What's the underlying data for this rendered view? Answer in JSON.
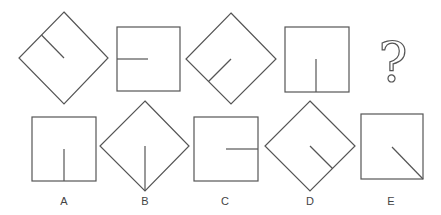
{
  "puzzle": {
    "stroke_color": "#555555",
    "background": "#ffffff",
    "sequence": [
      {
        "id": "seq-1",
        "shape": "diamond",
        "line": "upper-left-edge-midpoint-to-center"
      },
      {
        "id": "seq-2",
        "shape": "square",
        "line": "left-edge-midpoint-to-center"
      },
      {
        "id": "seq-3",
        "shape": "diamond",
        "line": "lower-left-edge-midpoint-to-center"
      },
      {
        "id": "seq-4",
        "shape": "square",
        "line": "bottom-edge-midpoint-to-center"
      }
    ],
    "unknown": {
      "symbol": "?"
    },
    "options": [
      {
        "label": "A",
        "shape": "square",
        "line": "bottom-edge-midpoint-to-center"
      },
      {
        "label": "B",
        "shape": "diamond",
        "line": "bottom-corner-to-center"
      },
      {
        "label": "C",
        "shape": "square",
        "line": "right-edge-midpoint-to-center"
      },
      {
        "label": "D",
        "shape": "diamond",
        "line": "lower-right-edge-midpoint-to-center"
      },
      {
        "label": "E",
        "shape": "square",
        "line": "bottom-right-corner-to-center"
      }
    ]
  }
}
